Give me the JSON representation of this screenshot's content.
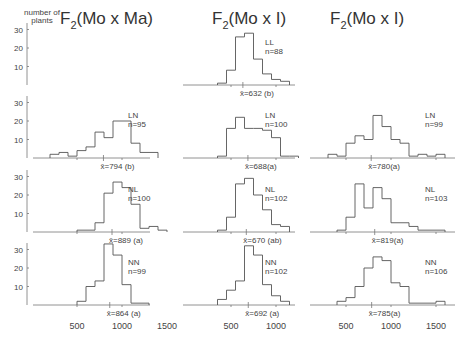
{
  "chart_data": {
    "type": "bar",
    "subtype": "histogram-grid",
    "y_axis_label": "number of plants",
    "y_ticks": [
      10,
      20,
      30
    ],
    "x_ticks": [
      500,
      1000,
      1500
    ],
    "bin_width": 100,
    "columns": [
      {
        "title": "F2(Mo x Ma)",
        "title_main": "F",
        "title_sub": "2",
        "title_rest": "(Mo x Ma)"
      },
      {
        "title": "F2(Mo x I)",
        "title_main": "F",
        "title_sub": "2",
        "title_rest": "(Mo x I)"
      },
      {
        "title": "F2(Mo x I)",
        "title_main": "F",
        "title_sub": "2",
        "title_rest": "(Mo x I)"
      }
    ],
    "panels": [
      {
        "row": 0,
        "col": 1,
        "genotype": "LL",
        "n_label": "n=88",
        "mean_label": "x̄=632 (b)",
        "mean": 632,
        "bin_start": 350,
        "counts": [
          1,
          8,
          26,
          28,
          14,
          6,
          3,
          2
        ]
      },
      {
        "row": 1,
        "col": 0,
        "genotype": "LN",
        "n_label": "n=95",
        "mean_label": "x̄=794 (b)",
        "mean": 794,
        "bin_start": 200,
        "counts": [
          2,
          3,
          1,
          4,
          6,
          14,
          11,
          20,
          20,
          8,
          3,
          3
        ]
      },
      {
        "row": 1,
        "col": 1,
        "genotype": "LN",
        "n_label": "n=100",
        "mean_label": "x̄=688(a)",
        "mean": 688,
        "bin_start": 350,
        "counts": [
          1,
          16,
          22,
          16,
          16,
          15,
          11,
          1,
          1
        ]
      },
      {
        "row": 1,
        "col": 2,
        "genotype": "LN",
        "n_label": "n=99",
        "mean_label": "x̄=780(a)",
        "mean": 780,
        "bin_start": 300,
        "counts": [
          2,
          1,
          8,
          12,
          10,
          23,
          17,
          10,
          8,
          1,
          2,
          1,
          2
        ]
      },
      {
        "row": 2,
        "col": 0,
        "genotype": "NL",
        "n_label": "n=100",
        "mean_label": "x̄=889 (a)",
        "mean": 889,
        "bin_start": 500,
        "counts": [
          1,
          1,
          5,
          21,
          27,
          24,
          15,
          2,
          3,
          1
        ]
      },
      {
        "row": 2,
        "col": 1,
        "genotype": "NL",
        "n_label": "n=102",
        "mean_label": "x̄=670 (ab)",
        "mean": 670,
        "bin_start": 350,
        "counts": [
          1,
          8,
          26,
          29,
          20,
          12,
          4,
          3
        ]
      },
      {
        "row": 2,
        "col": 2,
        "genotype": "NL",
        "n_label": "n=103",
        "mean_label": "x̄=819(a)",
        "mean": 819,
        "bin_start": 400,
        "counts": [
          1,
          8,
          26,
          13,
          24,
          18,
          5,
          5,
          3,
          1,
          1,
          1
        ]
      },
      {
        "row": 3,
        "col": 0,
        "genotype": "NN",
        "n_label": "n=99",
        "mean_label": "x̄=864 (a)",
        "mean": 864,
        "bin_start": 500,
        "counts": [
          2,
          10,
          13,
          33,
          27,
          11,
          1,
          1
        ]
      },
      {
        "row": 3,
        "col": 1,
        "genotype": "NN",
        "n_label": "n=102",
        "mean_label": "x̄=692 (a)",
        "mean": 692,
        "bin_start": 350,
        "counts": [
          3,
          8,
          13,
          32,
          27,
          11,
          5,
          2
        ]
      },
      {
        "row": 3,
        "col": 2,
        "genotype": "NN",
        "n_label": "n=106",
        "mean_label": "x̄=785(a)",
        "mean": 785,
        "bin_start": 400,
        "counts": [
          2,
          4,
          10,
          20,
          26,
          24,
          12,
          10,
          1,
          1,
          1,
          2
        ]
      }
    ]
  }
}
